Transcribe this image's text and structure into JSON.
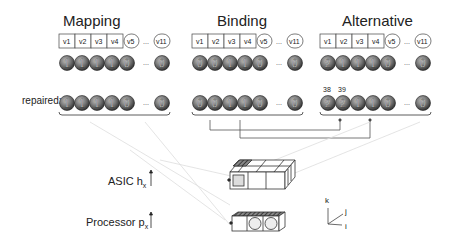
{
  "columns": [
    {
      "title": "Mapping",
      "vars": [
        "v1",
        "v2",
        "v3",
        "v4",
        "v5",
        "v11"
      ],
      "values": [
        "1",
        "1",
        "1",
        "1",
        "0",
        "0"
      ],
      "repaired": [
        "1",
        "1",
        "1",
        "1",
        "0",
        "0"
      ],
      "repaired_labels": []
    },
    {
      "title": "Binding",
      "vars": [
        "v1",
        "v2",
        "v3",
        "v4",
        "v5",
        "v11"
      ],
      "values": [
        "0",
        "0",
        "1",
        "1",
        "0",
        "0"
      ],
      "repaired": [
        "0",
        "0",
        "1",
        "1",
        "0",
        "0"
      ],
      "repaired_labels": []
    },
    {
      "title": "Alternative",
      "vars": [
        "v1",
        "v2",
        "v3",
        "v4",
        "v5",
        "v11"
      ],
      "values": [
        "2",
        "1",
        "1",
        "1",
        "0",
        "0"
      ],
      "repaired": [
        "2",
        "2",
        "1",
        "1",
        "0",
        "0"
      ],
      "repaired_labels": [
        "38",
        "39"
      ]
    }
  ],
  "labels": {
    "repaired": "repaired:",
    "ellipsis": "...",
    "asic": "ASIC h",
    "asic_sub": "x",
    "processor": "Processor p",
    "processor_sub": "x"
  },
  "axes": {
    "k": "k",
    "j": "j",
    "i": "i"
  }
}
